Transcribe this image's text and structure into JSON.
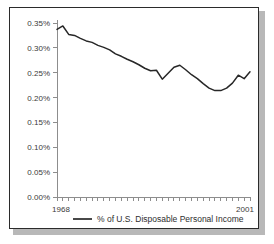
{
  "chart_data": {
    "type": "line",
    "title": "",
    "xlabel": "",
    "ylabel": "",
    "grid": false,
    "legend_position": "bottom",
    "xlim": [
      1968,
      2001
    ],
    "ylim": [
      0.0,
      0.35
    ],
    "x_tick_labels": [
      "1968",
      "2001"
    ],
    "y_tick_labels": [
      "0.00%",
      "0.05%",
      "0.10%",
      "0.15%",
      "0.20%",
      "0.25%",
      "0.30%",
      "0.35%"
    ],
    "y_tick_values": [
      0.0,
      0.05,
      0.1,
      0.15,
      0.2,
      0.25,
      0.3,
      0.35
    ],
    "x_minor_ticks_count": 34,
    "series": [
      {
        "name": "% of U.S. Disposable Personal Income",
        "color": "#272727",
        "x": [
          1968,
          1969,
          1970,
          1971,
          1972,
          1973,
          1974,
          1975,
          1976,
          1977,
          1978,
          1979,
          1980,
          1981,
          1982,
          1983,
          1984,
          1985,
          1986,
          1987,
          1988,
          1989,
          1990,
          1991,
          1992,
          1993,
          1994,
          1995,
          1996,
          1997,
          1998,
          1999,
          2000,
          2001
        ],
        "values": [
          0.337,
          0.344,
          0.327,
          0.325,
          0.319,
          0.314,
          0.311,
          0.305,
          0.301,
          0.296,
          0.288,
          0.283,
          0.277,
          0.272,
          0.266,
          0.259,
          0.254,
          0.255,
          0.237,
          0.249,
          0.261,
          0.265,
          0.256,
          0.246,
          0.238,
          0.228,
          0.219,
          0.214,
          0.214,
          0.219,
          0.229,
          0.245,
          0.238,
          0.252
        ]
      }
    ],
    "legend": [
      {
        "label": "% of U.S. Disposable Personal Income",
        "color": "#272727"
      }
    ]
  },
  "figure": {
    "frame_color": "#2b2b2b",
    "shadow_color": "#b8b8b8",
    "background": "#ffffff",
    "axis_color": "#8d8d8d"
  }
}
